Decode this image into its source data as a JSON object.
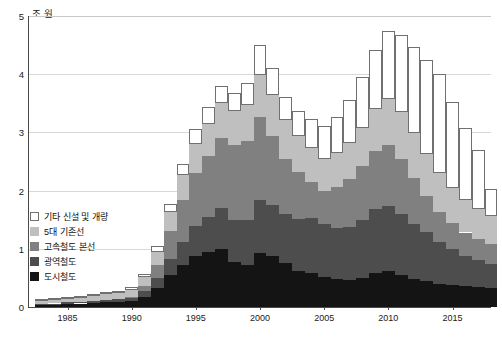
{
  "axes": {
    "unit_label": "조 원",
    "y_ticks": [
      "0",
      "1",
      "2",
      "3",
      "4",
      "5"
    ],
    "x_ticks": [
      "1985",
      "1990",
      "1995",
      "2000",
      "2005",
      "2010",
      "2015"
    ]
  },
  "legend": {
    "items": [
      {
        "label": "기타 신설 및 개량",
        "color": "#ffffff",
        "key": "etc"
      },
      {
        "label": "5대 기존선",
        "color": "#bfbfbf",
        "key": "five_lines"
      },
      {
        "label": "고속철도 본선",
        "color": "#808080",
        "key": "hsr_main"
      },
      {
        "label": "광역철도",
        "color": "#4d4d4d",
        "key": "metro_wide"
      },
      {
        "label": "도시철도",
        "color": "#141414",
        "key": "urban_rail"
      }
    ]
  },
  "chart_data": {
    "type": "bar",
    "stacked": true,
    "title": "",
    "subtitle": "",
    "xlabel": "",
    "ylabel": "조 원",
    "ylim": [
      0,
      5
    ],
    "xlim": [
      1982.5,
      2018.5
    ],
    "grid": true,
    "legend_position": "inside-left",
    "categories": [
      1983,
      1984,
      1985,
      1986,
      1987,
      1988,
      1989,
      1990,
      1991,
      1992,
      1993,
      1994,
      1995,
      1996,
      1997,
      1998,
      1999,
      2000,
      2001,
      2002,
      2003,
      2004,
      2005,
      2006,
      2007,
      2008,
      2009,
      2010,
      2011,
      2012,
      2013,
      2014,
      2015,
      2016,
      2017,
      2018
    ],
    "series": [
      {
        "name": "도시철도",
        "color": "#141414",
        "values": [
          0.03,
          0.04,
          0.05,
          0.06,
          0.07,
          0.08,
          0.09,
          0.1,
          0.18,
          0.32,
          0.55,
          0.72,
          0.88,
          0.95,
          1.0,
          0.78,
          0.72,
          0.92,
          0.88,
          0.75,
          0.62,
          0.58,
          0.52,
          0.48,
          0.46,
          0.5,
          0.58,
          0.62,
          0.55,
          0.48,
          0.44,
          0.4,
          0.38,
          0.36,
          0.34,
          0.32
        ]
      },
      {
        "name": "광역철도",
        "color": "#4d4d4d",
        "values": [
          0.02,
          0.02,
          0.03,
          0.03,
          0.03,
          0.04,
          0.05,
          0.06,
          0.1,
          0.18,
          0.28,
          0.4,
          0.52,
          0.6,
          0.7,
          0.72,
          0.78,
          0.92,
          0.88,
          0.85,
          0.9,
          0.95,
          0.9,
          0.88,
          0.92,
          1.0,
          1.1,
          1.12,
          1.05,
          0.95,
          0.85,
          0.72,
          0.62,
          0.52,
          0.46,
          0.42
        ]
      },
      {
        "name": "고속철도 본선",
        "color": "#808080",
        "values": [
          0.0,
          0.0,
          0.0,
          0.0,
          0.0,
          0.0,
          0.0,
          0.02,
          0.08,
          0.22,
          0.48,
          0.72,
          0.9,
          1.05,
          1.2,
          1.28,
          1.35,
          1.42,
          1.18,
          0.95,
          0.8,
          0.62,
          0.58,
          0.7,
          0.82,
          0.92,
          1.0,
          1.05,
          0.95,
          0.78,
          0.62,
          0.52,
          0.45,
          0.4,
          0.36,
          0.34
        ]
      },
      {
        "name": "5대 기존선",
        "color": "#bfbfbf",
        "values": [
          0.06,
          0.07,
          0.08,
          0.08,
          0.09,
          0.1,
          0.11,
          0.12,
          0.15,
          0.22,
          0.32,
          0.42,
          0.5,
          0.55,
          0.6,
          0.58,
          0.62,
          0.72,
          0.7,
          0.66,
          0.62,
          0.58,
          0.55,
          0.58,
          0.62,
          0.66,
          0.72,
          0.78,
          0.8,
          0.78,
          0.72,
          0.66,
          0.6,
          0.56,
          0.52,
          0.48
        ]
      },
      {
        "name": "기타 신설 및 개량",
        "color": "#ffffff",
        "values": [
          0.02,
          0.02,
          0.02,
          0.02,
          0.03,
          0.03,
          0.03,
          0.04,
          0.06,
          0.1,
          0.14,
          0.2,
          0.26,
          0.28,
          0.3,
          0.32,
          0.38,
          0.52,
          0.46,
          0.4,
          0.42,
          0.5,
          0.56,
          0.62,
          0.74,
          0.88,
          1.02,
          1.18,
          1.32,
          1.48,
          1.62,
          1.7,
          1.48,
          1.24,
          1.02,
          0.46
        ]
      }
    ],
    "totals": [
      0.13,
      0.15,
      0.18,
      0.19,
      0.22,
      0.25,
      0.28,
      0.34,
      0.57,
      1.04,
      1.77,
      2.46,
      3.06,
      3.43,
      3.8,
      3.68,
      3.85,
      4.5,
      4.1,
      3.61,
      3.36,
      3.23,
      3.11,
      3.26,
      3.56,
      3.96,
      4.42,
      4.75,
      4.67,
      4.47,
      4.25,
      4.0,
      3.53,
      3.08,
      2.7,
      2.02
    ]
  }
}
